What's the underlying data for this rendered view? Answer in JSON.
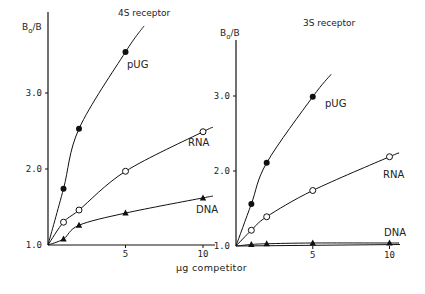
{
  "xlabel": "µg competitor",
  "chart_data": [
    {
      "type": "line",
      "title": "4S receptor",
      "xlabel": "µg competitor",
      "ylabel": "Bo/B",
      "xlim": [
        0,
        10.5
      ],
      "ylim": [
        1.0,
        3.7
      ],
      "xticks": [
        5,
        10
      ],
      "yticks": [
        1.0,
        2.0,
        3.0
      ],
      "ytick_labels": [
        "1.0",
        "2.0",
        "3.0"
      ],
      "grid": false,
      "series": [
        {
          "name": "pUG",
          "marker": "filled-circle",
          "x": [
            1,
            2,
            5
          ],
          "y": [
            1.74,
            2.53,
            3.54
          ]
        },
        {
          "name": "RNA",
          "marker": "open-circle",
          "x": [
            1,
            2,
            5,
            10
          ],
          "y": [
            1.3,
            1.46,
            1.97,
            2.49
          ]
        },
        {
          "name": "DNA",
          "marker": "filled-triangle",
          "x": [
            1,
            2,
            5,
            10
          ],
          "y": [
            1.08,
            1.26,
            1.42,
            1.62
          ]
        }
      ]
    },
    {
      "type": "line",
      "title": "3S receptor",
      "xlabel": "µg competitor",
      "ylabel": "Bo/B",
      "xlim": [
        0,
        10.5
      ],
      "ylim": [
        1.0,
        3.7
      ],
      "xticks": [
        5,
        10
      ],
      "yticks": [
        1.0,
        2.0,
        3.0
      ],
      "ytick_labels": [
        "1.0",
        "2.0",
        "3.0"
      ],
      "grid": false,
      "series": [
        {
          "name": "pUG",
          "marker": "filled-circle",
          "x": [
            1,
            2,
            5
          ],
          "y": [
            1.56,
            2.11,
            2.99
          ]
        },
        {
          "name": "RNA",
          "marker": "open-circle",
          "x": [
            1,
            2,
            5,
            10
          ],
          "y": [
            1.21,
            1.39,
            1.74,
            2.19
          ]
        },
        {
          "name": "DNA",
          "marker": "filled-triangle",
          "x": [
            1,
            2,
            5,
            10
          ],
          "y": [
            1.02,
            1.03,
            1.04,
            1.04
          ]
        }
      ]
    }
  ]
}
